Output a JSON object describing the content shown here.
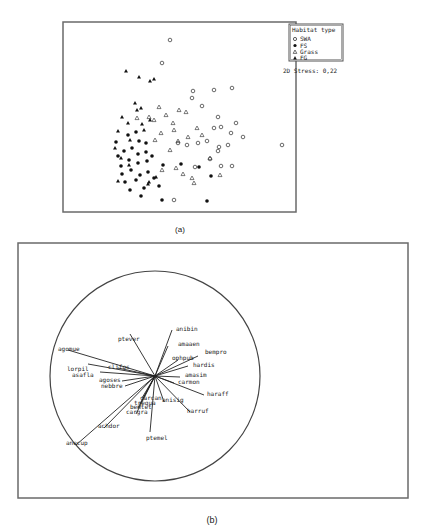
{
  "panel_a": {
    "caption": "(a)",
    "legend": {
      "title": "Habitat type",
      "items": [
        {
          "label": "SWA",
          "marker": "open-circle"
        },
        {
          "label": "FS",
          "marker": "filled-circle"
        },
        {
          "label": "Grass",
          "marker": "open-triangle"
        },
        {
          "label": "FG",
          "marker": "filled-triangle"
        }
      ]
    },
    "stress_label": "2D Stress: 0,22"
  },
  "panel_b": {
    "caption": "(b)"
  },
  "chart_data": [
    {
      "type": "scatter",
      "title": "NMDS ordination by habitat type",
      "annotation": "2D Stress: 0,22",
      "legend_position": "top-right",
      "grid": false,
      "axes_visible": false,
      "series": [
        {
          "name": "SWA",
          "marker": "open-circle",
          "points": [
            [
              170,
              40
            ],
            [
              162,
              63
            ],
            [
              193,
              91
            ],
            [
              214,
              90
            ],
            [
              232,
              88
            ],
            [
              192,
              98
            ],
            [
              202,
              106
            ],
            [
              218,
              117
            ],
            [
              236,
              123
            ],
            [
              214,
              128
            ],
            [
              221,
              127
            ],
            [
              231,
              133
            ],
            [
              282,
              145
            ],
            [
              198,
              143
            ],
            [
              207,
              141
            ],
            [
              228,
              145
            ],
            [
              243,
              137
            ],
            [
              219,
              147
            ],
            [
              178,
              143
            ],
            [
              187,
              145
            ],
            [
              210,
              159
            ],
            [
              195,
              167
            ],
            [
              221,
              166
            ],
            [
              232,
              166
            ],
            [
              218,
              151
            ],
            [
              174,
              200
            ]
          ]
        },
        {
          "name": "FS",
          "marker": "filled-circle",
          "points": [
            [
              136,
              132
            ],
            [
              128,
              135
            ],
            [
              139,
              141
            ],
            [
              146,
              143
            ],
            [
              132,
              148
            ],
            [
              124,
              151
            ],
            [
              138,
              154
            ],
            [
              146,
              152
            ],
            [
              152,
              156
            ],
            [
              129,
              160
            ],
            [
              138,
              163
            ],
            [
              147,
              161
            ],
            [
              121,
              166
            ],
            [
              131,
              170
            ],
            [
              140,
              175
            ],
            [
              148,
              172
            ],
            [
              136,
              180
            ],
            [
              125,
              182
            ],
            [
              154,
              178
            ],
            [
              163,
              165
            ],
            [
              181,
              164
            ],
            [
              199,
              167
            ],
            [
              211,
              176
            ],
            [
              116,
              142
            ],
            [
              122,
              174
            ],
            [
              130,
              190
            ],
            [
              141,
              196
            ],
            [
              162,
              200
            ],
            [
              207,
              201
            ],
            [
              159,
              186
            ],
            [
              144,
              188
            ],
            [
              118,
              156
            ]
          ]
        },
        {
          "name": "Grass",
          "marker": "open-triangle",
          "points": [
            [
              159,
              107
            ],
            [
              179,
              110
            ],
            [
              137,
              118
            ],
            [
              149,
              117
            ],
            [
              166,
              115
            ],
            [
              154,
              120
            ],
            [
              173,
              123
            ],
            [
              186,
              112
            ],
            [
              174,
              130
            ],
            [
              161,
              133
            ],
            [
              178,
              141
            ],
            [
              197,
              128
            ],
            [
              202,
              135
            ],
            [
              188,
              137
            ],
            [
              170,
              150
            ],
            [
              155,
              140
            ],
            [
              176,
              168
            ],
            [
              192,
              178
            ],
            [
              194,
              183
            ],
            [
              210,
              158
            ],
            [
              183,
              174
            ],
            [
              162,
              170
            ],
            [
              220,
              175
            ]
          ]
        },
        {
          "name": "FG",
          "marker": "filled-triangle",
          "points": [
            [
              126,
              71
            ],
            [
              139,
              77
            ],
            [
              150,
              81
            ],
            [
              154,
              79
            ],
            [
              135,
              103
            ],
            [
              141,
              108
            ],
            [
              122,
              117
            ],
            [
              128,
              123
            ],
            [
              142,
              124
            ],
            [
              118,
              131
            ],
            [
              130,
              140
            ],
            [
              115,
              148
            ],
            [
              121,
              158
            ],
            [
              129,
              165
            ],
            [
              118,
              181
            ],
            [
              149,
              182
            ],
            [
              156,
              177
            ],
            [
              148,
              184
            ],
            [
              150,
              120
            ],
            [
              144,
              130
            ],
            [
              137,
              110
            ]
          ]
        }
      ]
    },
    {
      "type": "biplot",
      "title": "Species vectors (correlation circle)",
      "circle": {
        "cx": 155,
        "cy": 376,
        "r": 105
      },
      "origin": [
        155,
        376
      ],
      "vectors": [
        {
          "name": "agomue",
          "end": [
            68,
            350
          ],
          "label_xy": [
            58,
            351
          ]
        },
        {
          "name": "ptever",
          "end": [
            130,
            334
          ],
          "label_xy": [
            118,
            341
          ]
        },
        {
          "name": "anibin",
          "end": [
            172,
            330
          ],
          "label_xy": [
            176,
            331
          ]
        },
        {
          "name": "amaaen",
          "end": [
            168,
            346
          ],
          "label_xy": [
            178,
            346
          ]
        },
        {
          "name": "bempro",
          "end": [
            198,
            356
          ],
          "label_xy": [
            205,
            354
          ]
        },
        {
          "name": "ophpub",
          "end": [
            178,
            360
          ],
          "label_xy": [
            172,
            360
          ]
        },
        {
          "name": "hardis",
          "end": [
            188,
            366
          ],
          "label_xy": [
            193,
            367
          ]
        },
        {
          "name": "amasim",
          "end": [
            180,
            377
          ],
          "label_xy": [
            185,
            377
          ]
        },
        {
          "name": "carmon",
          "end": [
            174,
            383
          ],
          "label_xy": [
            178,
            384
          ]
        },
        {
          "name": "haraff",
          "end": [
            204,
            395
          ],
          "label_xy": [
            207,
            396
          ]
        },
        {
          "name": "harruf",
          "end": [
            190,
            412
          ],
          "label_xy": [
            187,
            413
          ]
        },
        {
          "name": "anisig",
          "end": [
            164,
            402
          ],
          "label_xy": [
            162,
            402
          ]
        },
        {
          "name": "carcan",
          "end": [
            142,
            398
          ],
          "label_xy": [
            140,
            400
          ]
        },
        {
          "name": "trequa",
          "end": [
            140,
            404
          ],
          "label_xy": [
            134,
            405
          ]
        },
        {
          "name": "bemtet",
          "end": [
            138,
            408
          ],
          "label_xy": [
            130,
            409
          ]
        },
        {
          "name": "cargra",
          "end": [
            136,
            414
          ],
          "label_xy": [
            126,
            414
          ]
        },
        {
          "name": "achdor",
          "end": [
            104,
            428
          ],
          "label_xy": [
            98,
            428
          ]
        },
        {
          "name": "anecup",
          "end": [
            76,
            445
          ],
          "label_xy": [
            66,
            445
          ]
        },
        {
          "name": "ptemel",
          "end": [
            150,
            432
          ],
          "label_xy": [
            146,
            440
          ]
        },
        {
          "name": "lorpil",
          "end": [
            88,
            364
          ],
          "label_xy": [
            67,
            371
          ]
        },
        {
          "name": "asafla",
          "end": [
            100,
            372
          ],
          "label_xy": [
            72,
            377
          ]
        },
        {
          "name": "clifos",
          "end": [
            118,
            368
          ],
          "label_xy": [
            108,
            369
          ]
        },
        {
          "name": "agoses",
          "end": [
            122,
            381
          ],
          "label_xy": [
            99,
            382
          ]
        },
        {
          "name": "nebbre",
          "end": [
            125,
            386
          ],
          "label_xy": [
            101,
            388
          ]
        }
      ]
    }
  ]
}
